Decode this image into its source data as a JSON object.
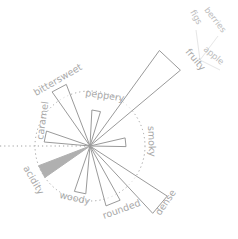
{
  "chart_data": {
    "type": "radial-wedge (flavor wheel)",
    "title": "",
    "center": [
      90,
      146
    ],
    "reference_circle_radius": 55,
    "categories": [
      "fruity",
      "smoky",
      "dense",
      "rounded",
      "woody",
      "acidity",
      "caramel",
      "bittersweet",
      "peppery"
    ],
    "series": [
      {
        "name": "intensity",
        "values": [
          {
            "label": "fruity",
            "angle_deg": -47,
            "length": 118,
            "highlighted": false
          },
          {
            "label": "smoky",
            "angle_deg": -6,
            "length": 36,
            "highlighted": false
          },
          {
            "label": "dense",
            "angle_deg": 40,
            "length": 92,
            "highlighted": false
          },
          {
            "label": "rounded",
            "angle_deg": 68,
            "length": 62,
            "highlighted": false
          },
          {
            "label": "woody",
            "angle_deg": 102,
            "length": 48,
            "highlighted": false
          },
          {
            "label": "acidity",
            "angle_deg": 152,
            "length": 55,
            "highlighted": true
          },
          {
            "label": "caramel",
            "angle_deg": -168,
            "length": 46,
            "highlighted": false
          },
          {
            "label": "bittersweet",
            "angle_deg": -118,
            "length": 66,
            "highlighted": false
          },
          {
            "label": "peppery",
            "angle_deg": -80,
            "length": 36,
            "highlighted": false
          }
        ]
      }
    ],
    "sub_labels": {
      "fruity": [
        "figs",
        "berries",
        "apple"
      ]
    },
    "colors": {
      "outline": "#9a9a9a",
      "highlight_fill": "#b0b0b0",
      "label": "#a8a8a8",
      "reference_circle": "#a0a0a0"
    }
  },
  "labels": {
    "fruity": "fruity",
    "figs": "figs",
    "berries": "berries",
    "apple": "apple",
    "smoky": "smoky",
    "dense": "dense",
    "rounded": "rounded",
    "woody": "woody",
    "acidity": "acidity",
    "caramel": "caramel",
    "bittersweet": "bittersweet",
    "peppery": "peppery"
  }
}
